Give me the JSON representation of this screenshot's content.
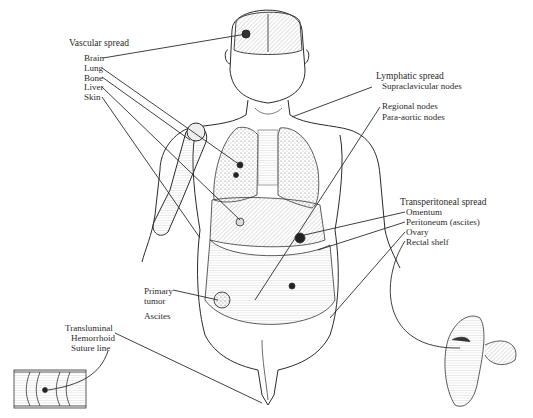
{
  "diagram": {
    "type": "anatomical illustration",
    "groups": {
      "vascular": {
        "heading": "Vascular spread",
        "items": [
          "Brain",
          "Lung",
          "Bone",
          "Liver",
          "Skin"
        ]
      },
      "lymphatic": {
        "heading": "Lymphatic spread",
        "items": [
          "Supraclavicular nodes",
          "Regional nodes",
          "Para-aortic nodes"
        ]
      },
      "transperitoneal": {
        "heading": "Transperitoneal spread",
        "items": [
          "Omentum",
          "Peritoneum (ascites)",
          "Ovary",
          "Rectal shelf"
        ]
      },
      "primary": {
        "items": [
          "Primary",
          "tumor",
          "Ascites"
        ]
      },
      "transluminal": {
        "items": [
          "Transluminal",
          "Hemorrhoid",
          "Suture line"
        ]
      }
    },
    "colors": {
      "ink": "#2a2a2a",
      "shade": "#8a8a8a",
      "background": "#ffffff"
    }
  }
}
